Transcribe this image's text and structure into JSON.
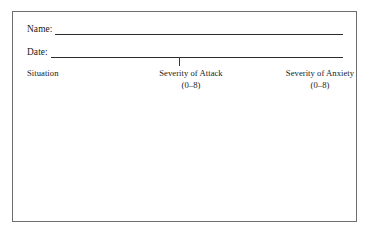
{
  "document": {
    "type": "printed-form",
    "background_color": "#ffffff",
    "frame_border_color": "#6e6e72",
    "text_color": "#1a1a1a",
    "rule_color": "#2a2a2e"
  },
  "fields": [
    {
      "label": "Name:",
      "value": "",
      "placeholder": ""
    },
    {
      "label": "Date:",
      "value": "",
      "placeholder": ""
    }
  ],
  "columns": [
    {
      "title": "Situation",
      "range": "",
      "align": "left"
    },
    {
      "title": "Severity of Attack",
      "range": "(0–8)",
      "align": "center"
    },
    {
      "title": "Severity of Anxiety",
      "range": "(0–8)",
      "align": "center"
    }
  ],
  "entries": []
}
